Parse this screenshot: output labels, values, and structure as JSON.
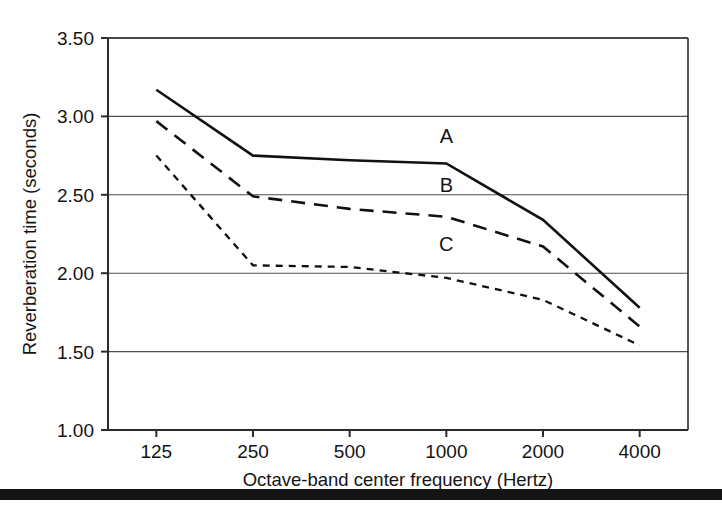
{
  "figure": {
    "background_color": "#ffffff",
    "ink_color": "#141414",
    "bottom_rule": {
      "name": "bottom-rule",
      "top": 489,
      "height": 11,
      "color": "#141414"
    }
  },
  "chart_data": {
    "type": "line",
    "title": "",
    "subtitle": "",
    "xlabel": "Octave-band center frequency (Hertz)",
    "ylabel": "Reverberation time (seconds)",
    "categories": [
      "125",
      "250",
      "500",
      "1000",
      "2000",
      "4000"
    ],
    "x_scale": "octave-band (categorical, evenly spaced)",
    "xlim": [
      0,
      5
    ],
    "ylim": [
      1.0,
      3.5
    ],
    "yticks": [
      "1.00",
      "1.50",
      "2.00",
      "2.50",
      "3.00",
      "3.50"
    ],
    "ytick_values": [
      1.0,
      1.5,
      2.0,
      2.5,
      3.0,
      3.5
    ],
    "grid": "horizontal",
    "legend": "inline labels on curves",
    "series": [
      {
        "name": "A",
        "style": "solid",
        "dash": "none",
        "stroke_width": 2.6,
        "values": [
          3.17,
          2.75,
          2.72,
          2.7,
          2.34,
          1.78
        ],
        "label_x_index": 3.0,
        "label_value": 2.83
      },
      {
        "name": "B",
        "style": "long-dash",
        "dash": "14,9",
        "stroke_width": 2.6,
        "values": [
          2.97,
          2.49,
          2.41,
          2.36,
          2.17,
          1.66
        ],
        "label_x_index": 3.0,
        "label_value": 2.52
      },
      {
        "name": "C",
        "style": "short-dash",
        "dash": "7,6",
        "stroke_width": 2.3,
        "values": [
          2.75,
          2.05,
          2.04,
          1.97,
          1.83,
          1.54
        ],
        "label_x_index": 3.0,
        "label_value": 2.14
      }
    ],
    "annotations": [
      {
        "text": "A",
        "series": "A"
      },
      {
        "text": "B",
        "series": "B"
      },
      {
        "text": "C",
        "series": "C"
      }
    ]
  },
  "plot_geometry": {
    "left": 108,
    "right": 688,
    "top": 38,
    "bottom": 430
  }
}
